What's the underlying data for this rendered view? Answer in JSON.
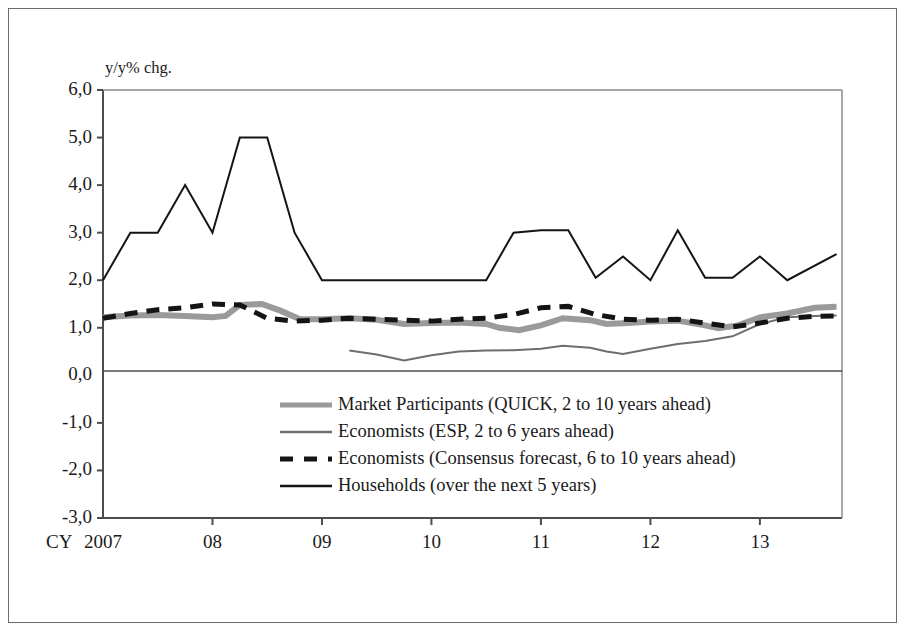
{
  "chart_data": {
    "type": "line",
    "title": "",
    "subtitle": "",
    "xlabel": "",
    "ylabel": "",
    "unit_label": "y/y% chg.",
    "xaxis_prefix": "CY",
    "xlim": [
      2007.0,
      2013.75
    ],
    "ylim": [
      -3.0,
      6.0
    ],
    "ytick_values": [
      6.0,
      5.0,
      4.0,
      3.0,
      2.0,
      1.0,
      0.0,
      -1.0,
      -2.0,
      -3.0
    ],
    "ytick_labels": [
      "6,0",
      "5,0",
      "4,0",
      "3,0",
      "2,0",
      "1,0",
      "0,0",
      "-1,0",
      "-2,0",
      "-3,0"
    ],
    "xtick_values": [
      2007,
      2008,
      2009,
      2010,
      2011,
      2012,
      2013
    ],
    "xtick_labels": [
      "2007",
      "08",
      "09",
      "10",
      "11",
      "12",
      "13"
    ],
    "grid": false,
    "zero_line": true,
    "legend_position": "center",
    "series": [
      {
        "name": "Market Participants (QUICK, 2 to 10 years ahead)",
        "key": "market-participants",
        "style": "solid-thick-gray",
        "color": "#9a9a9a",
        "width": 6,
        "points": [
          [
            2007.0,
            1.22
          ],
          [
            2007.25,
            1.26
          ],
          [
            2007.5,
            1.27
          ],
          [
            2007.75,
            1.25
          ],
          [
            2008.0,
            1.22
          ],
          [
            2008.12,
            1.25
          ],
          [
            2008.25,
            1.48
          ],
          [
            2008.45,
            1.5
          ],
          [
            2008.62,
            1.36
          ],
          [
            2008.8,
            1.18
          ],
          [
            2009.0,
            1.18
          ],
          [
            2009.25,
            1.2
          ],
          [
            2009.5,
            1.17
          ],
          [
            2009.75,
            1.08
          ],
          [
            2010.0,
            1.1
          ],
          [
            2010.25,
            1.11
          ],
          [
            2010.5,
            1.08
          ],
          [
            2010.62,
            1.0
          ],
          [
            2010.8,
            0.95
          ],
          [
            2011.0,
            1.05
          ],
          [
            2011.2,
            1.2
          ],
          [
            2011.45,
            1.16
          ],
          [
            2011.6,
            1.08
          ],
          [
            2011.8,
            1.1
          ],
          [
            2012.0,
            1.13
          ],
          [
            2012.25,
            1.15
          ],
          [
            2012.5,
            1.05
          ],
          [
            2012.62,
            0.99
          ],
          [
            2012.8,
            1.05
          ],
          [
            2013.0,
            1.22
          ],
          [
            2013.25,
            1.3
          ],
          [
            2013.5,
            1.42
          ],
          [
            2013.7,
            1.44
          ]
        ]
      },
      {
        "name": "Economists (ESP, 2 to 6 years ahead)",
        "key": "economists-esp",
        "style": "solid-thin-gray",
        "color": "#6e6e6e",
        "width": 2,
        "points": [
          [
            2009.25,
            0.52
          ],
          [
            2009.5,
            0.44
          ],
          [
            2009.75,
            0.31
          ],
          [
            2010.0,
            0.42
          ],
          [
            2010.25,
            0.5
          ],
          [
            2010.5,
            0.52
          ],
          [
            2010.75,
            0.53
          ],
          [
            2011.0,
            0.56
          ],
          [
            2011.2,
            0.62
          ],
          [
            2011.45,
            0.58
          ],
          [
            2011.6,
            0.5
          ],
          [
            2011.75,
            0.45
          ],
          [
            2012.0,
            0.56
          ],
          [
            2012.25,
            0.66
          ],
          [
            2012.5,
            0.72
          ],
          [
            2012.75,
            0.82
          ],
          [
            2013.0,
            1.08
          ],
          [
            2013.25,
            1.22
          ],
          [
            2013.5,
            1.25
          ],
          [
            2013.7,
            1.26
          ]
        ]
      },
      {
        "name": "Economists (Consensus forecast, 6 to 10 years ahead)",
        "key": "economists-consensus",
        "style": "dashed-black",
        "color": "#141414",
        "width": 5,
        "points": [
          [
            2007.0,
            1.2
          ],
          [
            2007.25,
            1.3
          ],
          [
            2007.5,
            1.38
          ],
          [
            2007.75,
            1.42
          ],
          [
            2008.0,
            1.5
          ],
          [
            2008.25,
            1.48
          ],
          [
            2008.5,
            1.2
          ],
          [
            2008.75,
            1.14
          ],
          [
            2009.0,
            1.16
          ],
          [
            2009.25,
            1.2
          ],
          [
            2009.5,
            1.18
          ],
          [
            2009.75,
            1.16
          ],
          [
            2010.0,
            1.14
          ],
          [
            2010.25,
            1.18
          ],
          [
            2010.5,
            1.2
          ],
          [
            2010.75,
            1.28
          ],
          [
            2011.0,
            1.42
          ],
          [
            2011.25,
            1.45
          ],
          [
            2011.5,
            1.28
          ],
          [
            2011.75,
            1.18
          ],
          [
            2012.0,
            1.16
          ],
          [
            2012.25,
            1.18
          ],
          [
            2012.5,
            1.1
          ],
          [
            2012.75,
            1.02
          ],
          [
            2013.0,
            1.1
          ],
          [
            2013.25,
            1.2
          ],
          [
            2013.5,
            1.24
          ],
          [
            2013.7,
            1.25
          ]
        ]
      },
      {
        "name": "Households (over the next 5 years)",
        "key": "households",
        "style": "solid-thin-black",
        "color": "#141414",
        "width": 2,
        "points": [
          [
            2007.0,
            2.0
          ],
          [
            2007.25,
            3.0
          ],
          [
            2007.5,
            3.0
          ],
          [
            2007.75,
            4.0
          ],
          [
            2008.0,
            3.0
          ],
          [
            2008.25,
            5.0
          ],
          [
            2008.5,
            5.0
          ],
          [
            2008.75,
            3.0
          ],
          [
            2009.0,
            2.0
          ],
          [
            2009.25,
            2.0
          ],
          [
            2009.5,
            2.0
          ],
          [
            2009.75,
            2.0
          ],
          [
            2010.0,
            2.0
          ],
          [
            2010.25,
            2.0
          ],
          [
            2010.5,
            2.0
          ],
          [
            2010.75,
            3.0
          ],
          [
            2011.0,
            3.05
          ],
          [
            2011.25,
            3.05
          ],
          [
            2011.5,
            2.05
          ],
          [
            2011.75,
            2.5
          ],
          [
            2012.0,
            2.0
          ],
          [
            2012.25,
            3.05
          ],
          [
            2012.5,
            2.05
          ],
          [
            2012.75,
            2.05
          ],
          [
            2013.0,
            2.5
          ],
          [
            2013.25,
            2.0
          ],
          [
            2013.7,
            2.55
          ]
        ]
      }
    ]
  },
  "legend": {
    "items": [
      {
        "label": "Market Participants (QUICK, 2 to 10 years ahead)",
        "swatch": "thick-gray-line"
      },
      {
        "label": "Economists (ESP, 2 to 6 years ahead)",
        "swatch": "thin-gray-line"
      },
      {
        "label": "Economists (Consensus forecast, 6 to 10 years ahead)",
        "swatch": "dashed-black-line"
      },
      {
        "label": "Households (over the next 5 years)",
        "swatch": "thin-black-line"
      }
    ]
  }
}
